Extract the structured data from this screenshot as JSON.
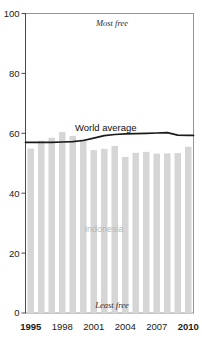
{
  "chart_data": {
    "type": "bar",
    "title": "",
    "xlabel": "",
    "ylabel": "",
    "ylim": [
      0,
      100
    ],
    "yticks": [
      0,
      20,
      40,
      60,
      80,
      100
    ],
    "ytick_labels": [
      "0",
      "20",
      "40",
      "60",
      "80",
      "100"
    ],
    "grid": false,
    "legend_position": "inline-annotation",
    "categories": [
      "1995",
      "1996",
      "1997",
      "1998",
      "1999",
      "2000",
      "2001",
      "2002",
      "2003",
      "2004",
      "2005",
      "2006",
      "2007",
      "2008",
      "2009",
      "2010"
    ],
    "xtick_labels": [
      "1995",
      "1998",
      "2001",
      "2004",
      "2007",
      "2010"
    ],
    "xtick_categories": [
      "1995",
      "1998",
      "2001",
      "2004",
      "2007",
      "2010"
    ],
    "series": [
      {
        "name": "Indonesia",
        "type": "bar",
        "color": "#d6d6d6",
        "values": [
          54.9,
          57.5,
          58.5,
          60.4,
          59.1,
          58.0,
          54.4,
          54.8,
          55.8,
          52.1,
          53.5,
          53.8,
          53.2,
          53.3,
          53.4,
          55.5
        ]
      },
      {
        "name": "World average",
        "type": "line",
        "color": "#1b1b1b",
        "values": [
          57.0,
          57.0,
          57.0,
          57.1,
          57.2,
          57.6,
          58.4,
          59.2,
          59.6,
          59.8,
          59.9,
          60.0,
          60.1,
          60.2,
          59.4,
          59.3
        ]
      }
    ],
    "annotations": [
      {
        "name": "most-free-note",
        "text": "Most free",
        "position": "top-center"
      },
      {
        "name": "least-free-note",
        "text": "Least free",
        "position": "bottom-center"
      },
      {
        "name": "series-label-world",
        "text": "World average",
        "position": "inline-line"
      },
      {
        "name": "series-label-indonesia",
        "text": "Indonesia",
        "position": "inside-bars"
      }
    ]
  },
  "labels": {
    "most_free": "Most free",
    "least_free": "Least free",
    "world_average": "World average",
    "indonesia": "Indonesia"
  },
  "colors": {
    "bar": "#d6d6d6",
    "line": "#1b1b1b",
    "frame": "#8a8a8a",
    "axis": "#4a4a4a",
    "bar_label": "#b8b8b8"
  }
}
